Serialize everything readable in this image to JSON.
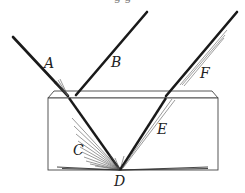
{
  "diagram": {
    "type": "light-reflection-refraction-in-glass-block",
    "caption_fragment": "g        g",
    "labels": {
      "A": "A",
      "B": "B",
      "C": "C",
      "D": "D",
      "E": "E",
      "F": "F"
    },
    "colors": {
      "ray": "#1a1a1a",
      "fan": "#555555",
      "block": "#444444",
      "background": "#ffffff"
    }
  }
}
